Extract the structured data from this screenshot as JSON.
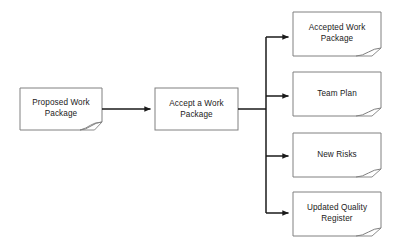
{
  "diagram": {
    "background_color": "#ffffff",
    "shape_fill": "#ffffff",
    "shape_border_color": "#808080",
    "connector_color": "#1a1a1a",
    "text_color": "#1a1a1a",
    "input": {
      "label": "Proposed Work\nPackage",
      "shape": "document",
      "x": 20,
      "y": 88,
      "w": 82,
      "h": 42
    },
    "process": {
      "label": "Accept a Work\nPackage",
      "shape": "process-rectangle",
      "x": 155,
      "y": 88,
      "w": 83,
      "h": 42
    },
    "outputs": [
      {
        "label": "Accepted Work\nPackage",
        "shape": "document",
        "x": 293,
        "y": 12,
        "w": 88,
        "h": 44
      },
      {
        "label": "Team Plan",
        "shape": "document",
        "x": 293,
        "y": 72,
        "w": 88,
        "h": 44
      },
      {
        "label": "New Risks",
        "shape": "document",
        "x": 293,
        "y": 133,
        "w": 88,
        "h": 44
      },
      {
        "label": "Updated Quality\nRegister",
        "shape": "document",
        "x": 293,
        "y": 192,
        "w": 88,
        "h": 44
      }
    ],
    "connectors": {
      "input_to_process": "arrow",
      "process_to_trunk": "line",
      "trunk_x": 266,
      "trunk_top": 37,
      "trunk_bottom": 213,
      "branch_arrows": 4
    }
  }
}
